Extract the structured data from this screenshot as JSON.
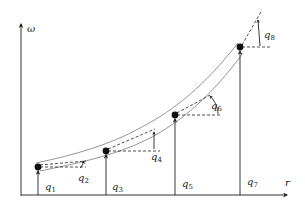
{
  "diagram": {
    "axes": {
      "y_label": "ω",
      "x_label": "r"
    },
    "points": [
      {
        "id": "p1",
        "x": 38,
        "y": 167
      },
      {
        "id": "p3",
        "x": 106,
        "y": 151
      },
      {
        "id": "p5",
        "x": 175,
        "y": 115
      },
      {
        "id": "p7",
        "x": 240,
        "y": 47
      }
    ],
    "labels": {
      "q1": {
        "base": "q",
        "sub": "1"
      },
      "q2": {
        "base": "q",
        "sub": "2"
      },
      "q3": {
        "base": "q",
        "sub": "3"
      },
      "q4": {
        "base": "q",
        "sub": "4"
      },
      "q5": {
        "base": "q",
        "sub": "5"
      },
      "q6": {
        "base": "q",
        "sub": "6"
      },
      "q7": {
        "base": "q",
        "sub": "7"
      },
      "q8": {
        "base": "q",
        "sub": "8"
      }
    },
    "colors": {
      "line": "#222222",
      "tube": "#8a8a8a",
      "axis": "#333333"
    }
  }
}
